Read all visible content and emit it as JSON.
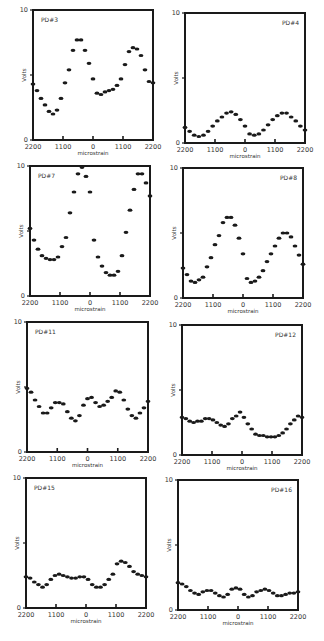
{
  "chart_data": {
    "type": "scatter",
    "layout": "4x2 grid of small multiples",
    "xlabel": "microstrain",
    "ylabel": "Volts",
    "x_tick_labels": [
      "2200",
      "1100",
      "0",
      "1100",
      "2200"
    ],
    "x_tick_values": [
      -2200,
      -1100,
      0,
      1100,
      2200
    ],
    "y_tick_labels": [
      "0",
      "",
      "10"
    ],
    "y_tick_values": [
      0,
      5,
      10
    ],
    "ylim": [
      0,
      10
    ],
    "xlim": [
      -2200,
      2200
    ],
    "grid": false,
    "legend": "none",
    "panels": [
      {
        "name": "PD#3",
        "label_pos": "left",
        "frame": {
          "x": 33,
          "y": 10,
          "w": 120,
          "h": 130
        },
        "values": [
          4.3,
          3.8,
          3.2,
          2.7,
          2.2,
          2.0,
          2.3,
          3.2,
          4.4,
          5.4,
          6.9,
          7.7,
          7.7,
          6.9,
          5.9,
          4.7,
          3.6,
          3.5,
          3.7,
          3.8,
          3.9,
          4.2,
          4.7,
          5.8,
          6.8,
          7.1,
          7.0,
          6.5,
          5.4,
          4.5,
          4.4
        ]
      },
      {
        "name": "PD#4",
        "label_pos": "right",
        "frame": {
          "x": 185,
          "y": 13,
          "w": 120,
          "h": 130
        },
        "values": [
          1.2,
          0.9,
          0.6,
          0.5,
          0.6,
          0.9,
          1.3,
          1.7,
          2.0,
          2.3,
          2.4,
          2.2,
          1.8,
          1.3,
          0.7,
          0.6,
          0.7,
          1.0,
          1.4,
          1.8,
          2.1,
          2.3,
          2.3,
          2.0,
          1.7,
          1.3,
          1.0
        ]
      },
      {
        "name": "PD#7",
        "label_pos": "left",
        "frame": {
          "x": 30,
          "y": 166,
          "w": 120,
          "h": 130
        },
        "values": [
          5.2,
          4.3,
          3.6,
          3.1,
          2.9,
          2.8,
          2.8,
          3.0,
          3.8,
          4.5,
          6.4,
          8.0,
          9.4,
          9.9,
          9.2,
          8.0,
          4.3,
          3.0,
          2.3,
          1.8,
          1.6,
          1.6,
          1.9,
          3.1,
          4.9,
          6.6,
          8.2,
          9.4,
          9.4,
          8.7,
          7.7
        ]
      },
      {
        "name": "PD#8",
        "label_pos": "right",
        "frame": {
          "x": 183,
          "y": 168,
          "w": 120,
          "h": 130
        },
        "values": [
          2.3,
          1.8,
          1.3,
          1.2,
          1.4,
          1.6,
          2.4,
          3.1,
          4.1,
          4.8,
          5.8,
          6.2,
          6.2,
          5.6,
          4.6,
          3.4,
          1.5,
          1.2,
          1.3,
          1.6,
          2.1,
          2.8,
          3.4,
          4.0,
          4.6,
          5.0,
          5.0,
          4.7,
          4.0,
          3.3,
          2.6
        ]
      },
      {
        "name": "PD#11",
        "label_pos": "left",
        "frame": {
          "x": 27,
          "y": 322,
          "w": 121,
          "h": 130
        },
        "values": [
          4.9,
          4.6,
          4.0,
          3.5,
          3.0,
          3.0,
          3.4,
          3.8,
          3.8,
          3.7,
          3.1,
          2.6,
          2.4,
          2.8,
          3.6,
          4.1,
          4.2,
          3.8,
          3.5,
          3.6,
          3.9,
          4.2,
          4.7,
          4.6,
          4.0,
          3.3,
          2.8,
          2.6,
          3.0,
          3.4,
          3.9
        ]
      },
      {
        "name": "PD#12",
        "label_pos": "right",
        "frame": {
          "x": 182,
          "y": 325,
          "w": 120,
          "h": 130
        },
        "values": [
          2.9,
          2.8,
          2.6,
          2.5,
          2.6,
          2.6,
          2.8,
          2.8,
          2.7,
          2.5,
          2.3,
          2.2,
          2.4,
          2.8,
          3.0,
          3.3,
          2.9,
          2.4,
          2.0,
          1.6,
          1.5,
          1.5,
          1.4,
          1.4,
          1.4,
          1.5,
          1.7,
          2.0,
          2.4,
          2.7,
          3.0,
          2.9
        ]
      },
      {
        "name": "PD#15",
        "label_pos": "left",
        "frame": {
          "x": 26,
          "y": 478,
          "w": 120,
          "h": 130
        },
        "values": [
          2.4,
          2.3,
          2.0,
          1.8,
          1.6,
          1.8,
          2.2,
          2.5,
          2.6,
          2.5,
          2.4,
          2.3,
          2.3,
          2.4,
          2.4,
          2.2,
          1.8,
          1.6,
          1.6,
          1.8,
          2.2,
          2.6,
          3.4,
          3.6,
          3.5,
          3.2,
          2.8,
          2.6,
          2.5,
          2.4
        ]
      },
      {
        "name": "PD#16",
        "label_pos": "right",
        "frame": {
          "x": 178,
          "y": 480,
          "w": 120,
          "h": 130
        },
        "values": [
          2.1,
          2.0,
          1.8,
          1.5,
          1.3,
          1.2,
          1.4,
          1.5,
          1.5,
          1.3,
          1.1,
          1.0,
          1.2,
          1.6,
          1.7,
          1.6,
          1.2,
          1.0,
          1.1,
          1.4,
          1.5,
          1.6,
          1.5,
          1.3,
          1.1,
          1.1,
          1.2,
          1.3,
          1.3,
          1.4
        ]
      }
    ]
  }
}
